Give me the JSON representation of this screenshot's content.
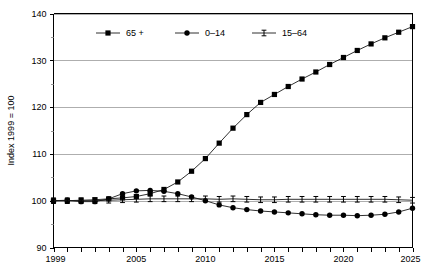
{
  "chart_data": {
    "type": "line",
    "title": "",
    "xlabel": "",
    "ylabel": "Index 1999 = 100",
    "xlim": [
      1999,
      2025
    ],
    "ylim": [
      90,
      140
    ],
    "grid": true,
    "legend_position": "top-center",
    "y_ticks_major": [
      90,
      100,
      110,
      120,
      130,
      140
    ],
    "y_ticks_minor": [
      95,
      105,
      115,
      125,
      135
    ],
    "y_tick_labels": [
      "90",
      "100",
      "110",
      "120",
      "130",
      "140"
    ],
    "x_ticks": [
      1999,
      2000,
      2001,
      2002,
      2003,
      2004,
      2005,
      2006,
      2007,
      2008,
      2009,
      2010,
      2011,
      2012,
      2013,
      2014,
      2015,
      2016,
      2017,
      2018,
      2019,
      2020,
      2021,
      2022,
      2023,
      2024,
      2025
    ],
    "x_tick_labels_shown": [
      "1999",
      "2005",
      "2010",
      "2015",
      "2020",
      "2025"
    ],
    "x_tick_label_years": [
      1999,
      2005,
      2010,
      2015,
      2020,
      2025
    ],
    "x": [
      1999,
      2000,
      2001,
      2002,
      2003,
      2004,
      2005,
      2006,
      2007,
      2008,
      2009,
      2010,
      2011,
      2012,
      2013,
      2014,
      2015,
      2016,
      2017,
      2018,
      2019,
      2020,
      2021,
      2022,
      2023,
      2024,
      2025
    ],
    "series": [
      {
        "name": "65 +",
        "marker": "square",
        "color": "#000000",
        "values": [
          100.0,
          100.0,
          100.1,
          100.2,
          100.4,
          100.6,
          100.9,
          101.5,
          102.4,
          104.0,
          106.3,
          109.0,
          112.3,
          115.5,
          118.4,
          121.0,
          122.7,
          124.4,
          126.0,
          127.5,
          129.1,
          130.6,
          132.1,
          133.5,
          134.8,
          136.0,
          137.2
        ]
      },
      {
        "name": "0–14",
        "marker": "circle",
        "color": "#000000",
        "values": [
          100.0,
          100.1,
          99.8,
          99.8,
          100.4,
          101.5,
          102.1,
          102.2,
          102.0,
          101.5,
          100.8,
          100.0,
          99.1,
          98.5,
          98.1,
          97.8,
          97.6,
          97.4,
          97.2,
          97.0,
          96.9,
          96.9,
          96.8,
          96.9,
          97.1,
          97.6,
          98.4
        ]
      },
      {
        "name": "15–64",
        "marker": "ibeam",
        "color": "#000000",
        "values": [
          100.0,
          100.0,
          100.0,
          100.0,
          100.1,
          100.2,
          100.3,
          100.4,
          100.4,
          100.4,
          100.4,
          100.4,
          100.3,
          100.4,
          100.3,
          100.2,
          100.2,
          100.3,
          100.3,
          100.3,
          100.3,
          100.3,
          100.3,
          100.3,
          100.3,
          100.2,
          100.1
        ]
      }
    ],
    "legend": [
      {
        "label": "65 +",
        "marker": "square"
      },
      {
        "label": "0–14",
        "marker": "circle"
      },
      {
        "label": "15–64",
        "marker": "ibeam"
      }
    ]
  }
}
